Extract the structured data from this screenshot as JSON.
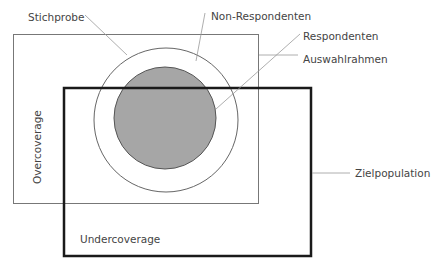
{
  "labels": {
    "stichprobe": "Stichprobe",
    "non_respondenten": "Non-Respondenten",
    "respondenten": "Respondenten",
    "auswahlrahmen": "Auswahlrahmen",
    "zielpopulation": "Zielpopulation",
    "overcoverage": "Overcoverage",
    "undercoverage": "Undercoverage"
  },
  "colors": {
    "background": "#ffffff",
    "respondenten_fill": "#a6a6a6",
    "line": "#777777",
    "thick_line": "#1a1a1a",
    "text": "#444444"
  }
}
